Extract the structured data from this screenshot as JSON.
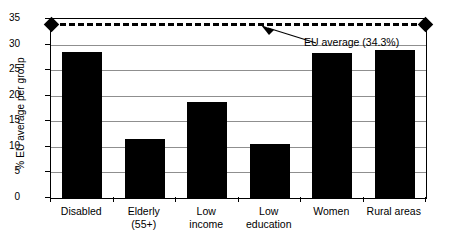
{
  "chart_data": {
    "type": "bar",
    "title": "",
    "subtitle": "",
    "xlabel": "",
    "ylabel": "% EU average per group",
    "ylim": [
      0,
      35
    ],
    "ytick_values": [
      35,
      30,
      25,
      20,
      15,
      10,
      5,
      0
    ],
    "ytick_labels": [
      "35",
      "30",
      "25",
      "20",
      "15",
      "10",
      "5",
      "0"
    ],
    "grid": true,
    "legend": false,
    "categories": [
      "Disabled",
      "Elderly (55+)",
      "Low income",
      "Low education",
      "Women",
      "Rural areas"
    ],
    "category_lines": [
      [
        "Disabled",
        ""
      ],
      [
        "Elderly",
        "(55+)"
      ],
      [
        "Low",
        "income"
      ],
      [
        "Low",
        "education"
      ],
      [
        "Women",
        ""
      ],
      [
        "Rural areas",
        ""
      ]
    ],
    "values": [
      28.5,
      11.5,
      18.8,
      10.6,
      28.3,
      28.9
    ],
    "bar_color": "#000000",
    "reference_line": {
      "label": "EU average (34.3%)",
      "value": 34.3,
      "style": "dashed",
      "color": "#000000",
      "endpoint_marker": "diamond"
    }
  },
  "axis": {
    "y_title": "% EU average per group"
  },
  "annotation": {
    "eu_average_text": "EU average (34.3%)"
  },
  "colors": {
    "bar": "#000000",
    "gridline": "#8f8f8f",
    "frame": "#000000",
    "background": "#ffffff"
  }
}
